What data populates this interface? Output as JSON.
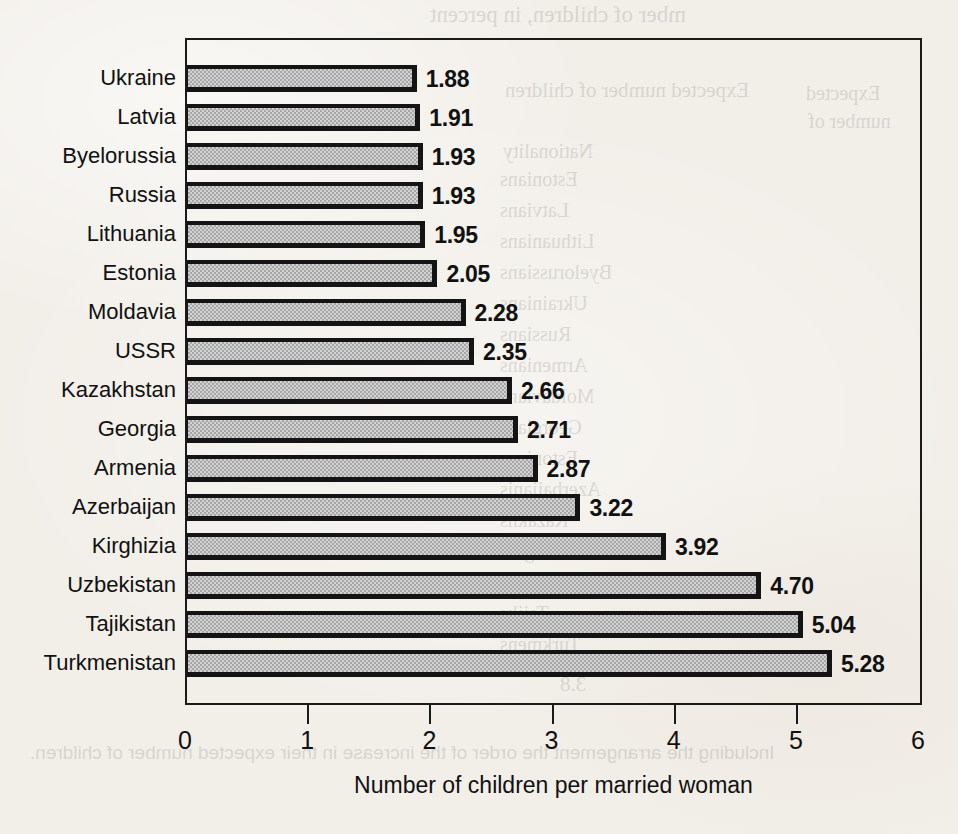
{
  "chart_data": {
    "type": "bar",
    "orientation": "horizontal",
    "title": "",
    "xlabel": "Number of children per married woman",
    "ylabel": "",
    "xlim": [
      0,
      6
    ],
    "xticks": [
      0,
      1,
      2,
      3,
      4,
      5,
      6
    ],
    "grid": false,
    "legend": null,
    "categories": [
      "Ukraine",
      "Latvia",
      "Byelorussia",
      "Russia",
      "Lithuania",
      "Estonia",
      "Moldavia",
      "USSR",
      "Kazakhstan",
      "Georgia",
      "Armenia",
      "Azerbaijan",
      "Kirghizia",
      "Uzbekistan",
      "Tajikistan",
      "Turkmenistan"
    ],
    "values": [
      1.88,
      1.91,
      1.93,
      1.93,
      1.95,
      2.05,
      2.28,
      2.35,
      2.66,
      2.71,
      2.87,
      3.22,
      3.92,
      4.7,
      5.04,
      5.28
    ],
    "value_labels": [
      "1.88",
      "1.91",
      "1.93",
      "1.93",
      "1.95",
      "2.05",
      "2.28",
      "2.35",
      "2.66",
      "2.71",
      "2.87",
      "3.22",
      "3.92",
      "4.70",
      "5.04",
      "5.28"
    ],
    "bar_color": "#b9b9b9",
    "bar_edge_color": "#141414"
  },
  "axis": {
    "tick_labels": [
      "0",
      "1",
      "2",
      "3",
      "4",
      "5",
      "6"
    ],
    "title": "Number of children per married woman"
  },
  "background_bleed": {
    "line_top": "mber of children, in percent",
    "line_expected": "Expected number of children",
    "line_expected2": "Expected",
    "line_numberof": "number of",
    "line_nationality": "Nationality",
    "rows": [
      "Estonians",
      "Latvians",
      "Lithuanians",
      "Byelorussians",
      "Ukrainians",
      "Russians",
      "Armenians",
      "Moldavians",
      "Georgians",
      "Estonians",
      "Azerbaijanis",
      "Kazakhs",
      "Kirghiz",
      "Uzbeks",
      "Tajiks",
      "Turkmens"
    ],
    "footer": "3.8",
    "footnote": "Including the arrangement the order of the increase in their expected number of children."
  },
  "colors": {
    "paper": "#f2efe9",
    "ink": "#111111",
    "bar_fill": "#b9b9b9",
    "bar_edge": "#141414"
  }
}
